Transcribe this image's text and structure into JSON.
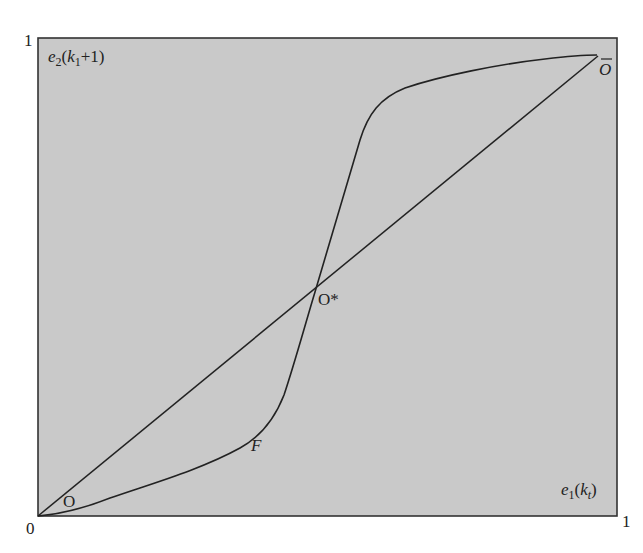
{
  "diagram": {
    "background_color": "#c9c9c9",
    "line_color": "#222222",
    "axes": {
      "origin_label": "0",
      "x_max_label": "1",
      "y_max_label": "1",
      "y_label": {
        "base": "e",
        "sub": "2",
        "open": "(k",
        "sub2": "1",
        "close": "+1)"
      },
      "x_label": {
        "base": "e",
        "sub": "1",
        "open": "(k",
        "sub2": "t",
        "close": ")"
      }
    },
    "points": {
      "O": "O",
      "O_bar": "O",
      "O_star": "O*",
      "F": "F"
    },
    "curves": [
      {
        "name": "45-degree line",
        "from": [
          0,
          0
        ],
        "to": [
          0.967,
          0.965
        ]
      },
      {
        "name": "S-shaped mapping",
        "passes_through": [
          "O",
          "F",
          "O*",
          "O-bar"
        ]
      }
    ]
  }
}
